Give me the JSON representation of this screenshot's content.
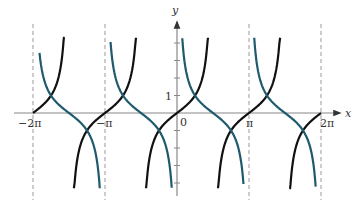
{
  "chart_data": {
    "type": "line",
    "title": "",
    "xlabel": "x",
    "ylabel": "y",
    "x_ticks": [
      {
        "value": -6.2832,
        "label": "−2π"
      },
      {
        "value": -3.1416,
        "label": "−π"
      },
      {
        "value": 0,
        "label": "0"
      },
      {
        "value": 3.1416,
        "label": "π"
      },
      {
        "value": 6.2832,
        "label": "2π"
      }
    ],
    "y_ticks": [
      {
        "value": 1,
        "label": "1"
      }
    ],
    "xlim": [
      -6.6,
      7.6
    ],
    "ylim": [
      -4.3,
      4.3
    ],
    "grid": false,
    "asymptotes_x": [
      -6.2832,
      -3.1416,
      3.1416,
      6.2832
    ],
    "series": [
      {
        "name": "tan x",
        "color": "#111111",
        "function": "tan",
        "branches": [
          [
            -6.2832,
            -4.9
          ],
          [
            -4.5,
            -1.79
          ],
          [
            -1.35,
            1.35
          ],
          [
            1.79,
            4.5
          ],
          [
            4.9,
            6.2832
          ]
        ]
      },
      {
        "name": "cot x",
        "color": "#1f5a6e",
        "function": "cot",
        "branches": [
          [
            -6.0,
            -3.37
          ],
          [
            -2.9,
            -0.23
          ],
          [
            0.23,
            2.9
          ],
          [
            3.37,
            6.05
          ]
        ]
      }
    ]
  },
  "labels": {
    "x_axis": "x",
    "y_axis": "y",
    "neg_two_pi": "−2π",
    "neg_pi": "−π",
    "origin": "0",
    "pi": "π",
    "two_pi": "2π",
    "one": "1"
  },
  "colors": {
    "tan": "#111111",
    "cot": "#1f5a6e",
    "axis": "#888888",
    "asymptote": "#9a9a9a"
  }
}
